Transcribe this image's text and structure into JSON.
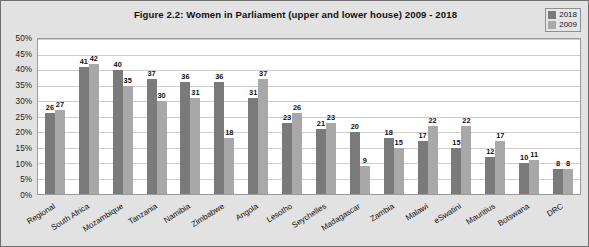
{
  "figure": {
    "title": "Figure 2.2: Women in Parliament (upper and lower house) 2009 - 2018"
  },
  "legend": {
    "position": "top-right",
    "entries": [
      {
        "label": "2018",
        "color": "#7a7a7a"
      },
      {
        "label": "2009",
        "color": "#a8a8a8"
      }
    ]
  },
  "axis": {
    "y_ticks": [
      "0%",
      "5%",
      "10%",
      "15%",
      "20%",
      "25%",
      "30%",
      "35%",
      "40%",
      "45%",
      "50%"
    ]
  },
  "chart_data": {
    "type": "bar",
    "title": "Figure 2.2: Women in Parliament (upper and lower house) 2009 - 2018",
    "xlabel": "",
    "ylabel": "",
    "ylim": [
      0,
      50
    ],
    "ytick_step": 5,
    "ytick_suffix": "%",
    "grid": true,
    "legend_position": "top-right",
    "categories": [
      "Regional",
      "South Africa",
      "Mozambique",
      "Tanzania",
      "Namibia",
      "Zimbabwe",
      "Angola",
      "Lesotho",
      "Seychelles",
      "Madagascar",
      "Zambia",
      "Malawi",
      "eSwatini",
      "Mauritius",
      "Botswana",
      "DRC"
    ],
    "series": [
      {
        "name": "2018",
        "color": "#7a7a7a",
        "values": [
          26,
          41,
          40,
          37,
          36,
          36,
          31,
          23,
          21,
          20,
          18,
          17,
          15,
          12,
          10,
          8
        ]
      },
      {
        "name": "2009",
        "color": "#a8a8a8",
        "values": [
          27,
          42,
          35,
          30,
          31,
          18,
          37,
          26,
          23,
          9,
          15,
          22,
          22,
          17,
          11,
          8
        ]
      }
    ]
  }
}
